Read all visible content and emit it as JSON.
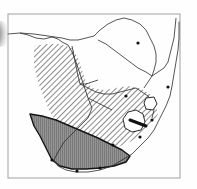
{
  "figure": {
    "title": "Southern Africa species distribution map",
    "caption": "",
    "width": 197,
    "height": 189,
    "background_color": "#fefefe",
    "frame": {
      "label": "map-frame",
      "x": 8,
      "y": 14,
      "width": 172,
      "height": 164,
      "stroke_color": "#a8a8a8",
      "stroke_width": 1.1
    },
    "scan_artifact": {
      "label": "scan edge shadow",
      "color": "#4a4a4a",
      "x": 0,
      "y": 21,
      "width": 11,
      "height": 26
    }
  },
  "legend": {
    "hatched_region": {
      "name": "Diagonal hatched distribution area",
      "pattern": "diagonal-hatch-45",
      "line_color": "#2b2b2b",
      "line_spacing_px": 4,
      "angle_degrees": 45,
      "fill_color": "#ffffff"
    },
    "solid_region": {
      "name": "Solid shaded core area",
      "pattern": "vertical-line-fill",
      "fill_color": "#8c8c8c",
      "line_color": "#555555",
      "outline_color": "#141414",
      "line_spacing_px": 2
    },
    "coastline": {
      "name": "Coastline and country borders",
      "stroke_color": "#2a2a2a",
      "stroke_width": 0.8
    },
    "locality_dot": {
      "name": "Locality record marker",
      "color": "#101010",
      "radius_px": 1.6
    }
  },
  "geography": {
    "coastline_path": "M 8 34 L 20 33 L 28 35 L 36 38 L 44 39 L 52 37 L 58 39 L 62 42 L 68 45 L 72 52 L 76 62 L 80 74 L 84 86 L 88 98 L 92 108 L 88 118 L 80 126 L 72 134 L 64 142 L 58 152 L 54 160 L 58 166 L 66 170 L 76 172 L 88 172 L 100 170 L 112 166 L 122 160 L 132 154 L 140 146 L 148 138 L 154 130 L 158 122 L 162 114 L 166 106 L 170 96 L 172 86 L 174 74 L 176 62 L 178 50 L 179 38 L 179 22",
    "country_borders": [
      {
        "name": "namibia-botswana-border",
        "path": "M 72 46 L 74 56 L 76 66 L 78 76 L 80 84 L 86 84 L 92 82 L 98 80"
      },
      {
        "name": "angola-namibia-border",
        "path": "M 20 33 L 34 34 L 48 36 L 62 38 L 70 40 L 78 40 L 86 38 L 94 36"
      },
      {
        "name": "zambia-zimbabwe-border",
        "path": "M 94 36 L 100 30 L 108 24 L 116 20 L 124 18 L 132 20 L 140 24 L 146 30 L 150 38"
      },
      {
        "name": "botswana-zimbabwe-border",
        "path": "M 98 40 L 106 44 L 114 50 L 122 56 L 130 62 L 138 68 L 146 72 L 152 76"
      },
      {
        "name": "botswana-south-africa-border",
        "path": "M 80 84 L 88 88 L 96 92 L 104 94 L 112 94 L 120 92 L 128 90 L 136 88"
      },
      {
        "name": "zimbabwe-mozambique-border",
        "path": "M 150 38 L 154 46 L 156 54 L 156 62 L 154 70 L 152 76 L 148 82 L 144 88"
      },
      {
        "name": "south-africa-mozambique-border",
        "path": "M 136 88 L 142 92 L 148 96 L 152 102 L 154 110 L 152 118"
      },
      {
        "name": "mozambique-coast",
        "path": "M 152 76 L 158 72 L 164 68 L 168 62 L 170 54 L 172 46 L 174 38 L 175 28 L 176 18"
      },
      {
        "name": "namibia-south-africa-border",
        "path": "M 88 98 L 96 102 L 104 106 L 112 110"
      }
    ],
    "enclaves": [
      {
        "name": "lesotho",
        "path": "M 128 112 L 136 110 L 143 114 L 145 122 L 141 130 L 132 132 L 125 128 L 123 119 Z"
      },
      {
        "name": "swaziland",
        "path": "M 146 98 L 154 97 L 157 104 L 153 110 L 146 109 L 144 103 Z"
      }
    ]
  },
  "overlays": {
    "hatched_area_path": "M 34 46 L 46 44 L 60 44 L 72 48 L 78 58 L 82 70 L 86 82 L 92 88 L 104 90 L 116 88 L 128 86 L 140 88 L 150 94 L 156 104 L 158 114 L 152 124 L 142 134 L 130 142 L 116 148 L 102 150 L 88 148 L 76 142 L 66 134 L 58 124 L 50 112 L 44 98 L 38 82 L 34 66 Z",
    "solid_area_path": "M 30 114 L 42 116 L 56 120 L 70 126 L 84 132 L 98 138 L 110 144 L 122 150 L 130 156 L 126 162 L 114 166 L 100 168 L 86 169 L 72 169 L 60 166 L 52 160 L 48 152 L 44 144 L 40 136 L 34 126 Z"
  },
  "markers": [
    {
      "name": "locality-harare",
      "x": 138,
      "y": 43
    },
    {
      "name": "locality-coastal-north",
      "x": 168,
      "y": 87
    },
    {
      "name": "locality-durban",
      "x": 152,
      "y": 120
    },
    {
      "name": "locality-east-london",
      "x": 140,
      "y": 137
    },
    {
      "name": "locality-cape-south",
      "x": 100,
      "y": 168
    },
    {
      "name": "locality-cape-west",
      "x": 52,
      "y": 160
    },
    {
      "name": "locality-mossel-bay",
      "x": 77,
      "y": 171
    },
    {
      "name": "locality-gauteng",
      "x": 126,
      "y": 96
    },
    {
      "name": "locality-eastern-cape",
      "x": 113,
      "y": 145
    }
  ],
  "annotations": [
    {
      "name": "coastal-bar-marker",
      "x1": 130,
      "y1": 120,
      "x2": 146,
      "y2": 126,
      "color": "#111111",
      "stroke_width": 3
    }
  ],
  "chart_data": {
    "type": "map",
    "title": "Southern Africa species distribution map",
    "regions": [
      {
        "label": "Hatched distribution range",
        "pattern": "diagonal hatch (45 degrees)",
        "countries": [
          "Namibia",
          "Botswana",
          "South Africa (north and east)"
        ]
      },
      {
        "label": "Solid shaded core range",
        "pattern": "solid grey with vertical lines",
        "countries": [
          "South Africa (Western and Southern Cape)"
        ]
      }
    ],
    "country_outlines": [
      "Angola",
      "Zambia",
      "Zimbabwe",
      "Mozambique",
      "Namibia",
      "Botswana",
      "South Africa",
      "Lesotho",
      "Swaziland"
    ],
    "marker_count": 9,
    "legend": "none shown"
  }
}
